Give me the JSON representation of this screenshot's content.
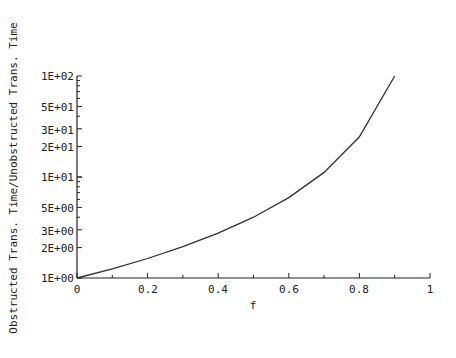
{
  "chart_data": {
    "type": "line",
    "title": "",
    "xlabel": "f",
    "ylabel": "Obstructed Trans. Time/Unobstructed Trans. Time",
    "xlim": [
      0,
      1
    ],
    "ylim": [
      1,
      100
    ],
    "yscale": "log",
    "grid": false,
    "legend": null,
    "x_ticks": [
      "0",
      "0.2",
      "0.4",
      "0.6",
      "0.8",
      "1"
    ],
    "y_ticks": [
      "1E+00",
      "2E+00",
      "3E+00",
      "5E+00",
      "1E+01",
      "2E+01",
      "3E+01",
      "5E+01",
      "1E+02"
    ],
    "series": [
      {
        "name": "ratio",
        "x": [
          0,
          0.1,
          0.2,
          0.3,
          0.4,
          0.5,
          0.6,
          0.7,
          0.8,
          0.9
        ],
        "y": [
          1.0,
          1.23,
          1.56,
          2.04,
          2.78,
          4.0,
          6.25,
          11.1,
          25.0,
          100.0
        ]
      }
    ]
  }
}
